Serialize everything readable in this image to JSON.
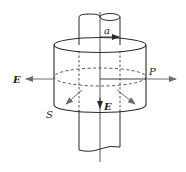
{
  "diagram": {
    "labels": {
      "radius": "a",
      "field_left": "E",
      "field_axial": "E",
      "point": "P",
      "poynting": "S"
    },
    "colors": {
      "stroke": "#2a2a2a",
      "arrow": "#6b6b6b",
      "background": "#ffffff"
    }
  }
}
